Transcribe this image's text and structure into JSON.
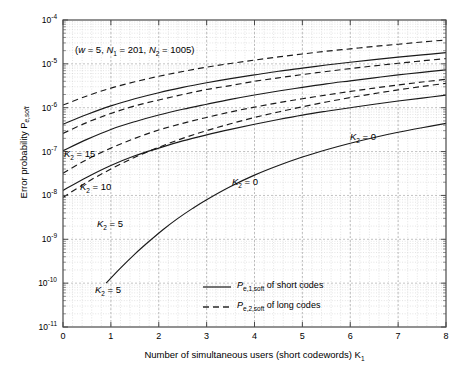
{
  "chart_data": {
    "type": "line",
    "title": "",
    "xlabel": "Number of simultaneous users  (short codewords)   K",
    "xlabel_sub": "1",
    "ylabel": "Error probability   P",
    "ylabel_sub": "e,soft",
    "annotation": "(w = 5, N1 = 201, N2 = 1005)",
    "annotation_parts": {
      "open": "(",
      "w": "w",
      "w_val": " = 5, ",
      "n1": "N",
      "n1_sub": "1",
      "n1_val": " = 201, ",
      "n2": "N",
      "n2_sub": "2",
      "n2_val": " = 1005)"
    },
    "xlim": [
      0,
      8
    ],
    "ylim": [
      1e-11,
      0.0001
    ],
    "yscale": "log",
    "xscale": "linear",
    "xticks": [
      0,
      1,
      2,
      3,
      4,
      5,
      6,
      7,
      8
    ],
    "xticklabels": [
      "0",
      "1",
      "2",
      "3",
      "4",
      "5",
      "6",
      "7",
      "8"
    ],
    "yticks": [
      0.0001,
      1e-05,
      1e-06,
      1e-07,
      1e-08,
      1e-09,
      1e-10,
      1e-11
    ],
    "yticklabels": [
      "10-4",
      "10-5",
      "10-6",
      "10-7",
      "10-8",
      "10-9",
      "10-10",
      "10-11"
    ],
    "yticklabels_exp": [
      "-4",
      "-5",
      "-6",
      "-7",
      "-8",
      "-9",
      "-10",
      "-11"
    ],
    "grid": true,
    "grid_minor": true,
    "legend": {
      "position": "lower-center-right",
      "entries": [
        {
          "style": "solid",
          "symbol": "P",
          "sub": "e,1,soft",
          "text": " of short codes"
        },
        {
          "style": "dashed",
          "symbol": "P",
          "sub": "e,2,soft",
          "text": " of long codes"
        }
      ]
    },
    "curve_labels": [
      {
        "text": "K",
        "sub": "2",
        "value": " = 15",
        "x_px": 64,
        "y_px": 148
      },
      {
        "text": "K",
        "sub": "2",
        "value": " = 10",
        "x_px": 80,
        "y_px": 181
      },
      {
        "text": "K",
        "sub": "2",
        "value": " = 5",
        "x_px": 97,
        "y_px": 218
      },
      {
        "text": "K",
        "sub": "2",
        "value": " = 5",
        "x_px": 95,
        "y_px": 284
      },
      {
        "text": "K",
        "sub": "2",
        "value": " = 0",
        "x_px": 232,
        "y_px": 176
      },
      {
        "text": "K",
        "sub": "2",
        "value": " = 0",
        "x_px": 350,
        "y_px": 131
      }
    ],
    "series": [
      {
        "name": "Pe,1,soft K2=15",
        "style": "solid",
        "label": "K2 = 15",
        "points": [
          [
            0,
            1.05e-07
          ],
          [
            0.5,
            1.9e-07
          ],
          [
            1,
            3.2e-07
          ],
          [
            1.5,
            4.8e-07
          ],
          [
            2,
            6.8e-07
          ],
          [
            2.5,
            9.2e-07
          ],
          [
            3,
            1.2e-06
          ],
          [
            3.5,
            1.55e-06
          ],
          [
            4,
            1.95e-06
          ],
          [
            4.5,
            2.4e-06
          ],
          [
            5,
            2.9e-06
          ],
          [
            5.5,
            3.5e-06
          ],
          [
            6,
            4.1e-06
          ],
          [
            6.5,
            4.8e-06
          ],
          [
            7,
            5.6e-06
          ],
          [
            7.5,
            6.4e-06
          ],
          [
            8,
            7.3e-06
          ]
        ]
      },
      {
        "name": "Pe,2,soft K2=15",
        "style": "dashed",
        "label": "K2 = 15",
        "points": [
          [
            0,
            2.6e-07
          ],
          [
            0.5,
            4.6e-07
          ],
          [
            1,
            7.4e-07
          ],
          [
            1.5,
            1.1e-06
          ],
          [
            2,
            1.5e-06
          ],
          [
            2.5,
            2e-06
          ],
          [
            3,
            2.6e-06
          ],
          [
            3.5,
            3.2e-06
          ],
          [
            4,
            4e-06
          ],
          [
            4.5,
            4.8e-06
          ],
          [
            5,
            5.7e-06
          ],
          [
            5.5,
            6.7e-06
          ],
          [
            6,
            7.8e-06
          ],
          [
            6.5,
            9e-06
          ],
          [
            7,
            1.03e-05
          ],
          [
            7.5,
            1.17e-05
          ],
          [
            8,
            1.32e-05
          ]
        ]
      },
      {
        "name": "Pe,1,soft K2=10",
        "style": "solid",
        "label": "K2 = 10",
        "points": [
          [
            0,
            1.3e-08
          ],
          [
            0.5,
            2.6e-08
          ],
          [
            1,
            4.8e-08
          ],
          [
            1.5,
            8e-08
          ],
          [
            2,
            1.2e-07
          ],
          [
            2.5,
            1.75e-07
          ],
          [
            3,
            2.4e-07
          ],
          [
            3.5,
            3.2e-07
          ],
          [
            4,
            4.2e-07
          ],
          [
            4.5,
            5.4e-07
          ],
          [
            5,
            6.8e-07
          ],
          [
            5.5,
            8.3e-07
          ],
          [
            6,
            1e-06
          ],
          [
            6.5,
            1.2e-06
          ],
          [
            7,
            1.42e-06
          ],
          [
            7.5,
            1.66e-06
          ],
          [
            8,
            1.93e-06
          ]
        ]
      },
      {
        "name": "Pe,2,soft K2=10",
        "style": "dashed",
        "label": "K2 = 10",
        "points": [
          [
            0,
            3.2e-08
          ],
          [
            0.5,
            6.6e-08
          ],
          [
            1,
            1.2e-07
          ],
          [
            1.5,
            2e-07
          ],
          [
            2,
            3.1e-07
          ],
          [
            2.5,
            4.4e-07
          ],
          [
            3,
            6e-07
          ],
          [
            3.5,
            8e-07
          ],
          [
            4,
            1.03e-06
          ],
          [
            4.5,
            1.3e-06
          ],
          [
            5,
            1.6e-06
          ],
          [
            5.5,
            1.95e-06
          ],
          [
            6,
            2.35e-06
          ],
          [
            6.5,
            2.8e-06
          ],
          [
            7,
            3.3e-06
          ],
          [
            7.5,
            3.85e-06
          ],
          [
            8,
            4.45e-06
          ]
        ]
      },
      {
        "name": "Pe,1,soft K2=5",
        "style": "solid",
        "label": "K2 = 5",
        "points": [
          [
            0.9,
            1e-10
          ],
          [
            1.2,
            2.2e-10
          ],
          [
            1.5,
            4.6e-10
          ],
          [
            1.8,
            9e-10
          ],
          [
            2.1,
            1.7e-09
          ],
          [
            2.4,
            3e-09
          ],
          [
            2.7,
            5e-09
          ],
          [
            3,
            8e-09
          ],
          [
            3.5,
            1.6e-08
          ],
          [
            4,
            2.9e-08
          ],
          [
            4.5,
            4.8e-08
          ],
          [
            5,
            7.5e-08
          ],
          [
            5.5,
            1.1e-07
          ],
          [
            6,
            1.55e-07
          ],
          [
            6.5,
            2.1e-07
          ],
          [
            7,
            2.75e-07
          ],
          [
            7.5,
            3.5e-07
          ],
          [
            8,
            4.4e-07
          ]
        ]
      },
      {
        "name": "Pe,2,soft K2=5",
        "style": "dashed",
        "label": "K2 = 5",
        "points": [
          [
            0,
            9e-09
          ],
          [
            0.5,
            2e-08
          ],
          [
            1,
            4e-08
          ],
          [
            1.5,
            7.4e-08
          ],
          [
            2,
            1.25e-07
          ],
          [
            2.5,
            2e-07
          ],
          [
            3,
            3e-07
          ],
          [
            3.5,
            4.3e-07
          ],
          [
            4,
            6e-07
          ],
          [
            4.5,
            8e-07
          ],
          [
            5,
            1.05e-06
          ],
          [
            5.5,
            1.35e-06
          ],
          [
            6,
            1.7e-06
          ],
          [
            6.5,
            2.1e-06
          ],
          [
            7,
            2.55e-06
          ],
          [
            7.5,
            3.05e-06
          ],
          [
            8,
            3.6e-06
          ]
        ]
      },
      {
        "name": "Pe,1,soft K2=0",
        "style": "solid",
        "label": "K2 = 0",
        "points": [
          [
            0,
            4.2e-07
          ],
          [
            0.5,
            7e-07
          ],
          [
            1,
            1.1e-06
          ],
          [
            1.5,
            1.6e-06
          ],
          [
            2,
            2.2e-06
          ],
          [
            2.5,
            2.9e-06
          ],
          [
            3,
            3.7e-06
          ],
          [
            3.5,
            4.6e-06
          ],
          [
            4,
            5.6e-06
          ],
          [
            4.5,
            6.8e-06
          ],
          [
            5,
            8e-06
          ],
          [
            5.5,
            9.4e-06
          ],
          [
            6,
            1.09e-05
          ],
          [
            6.5,
            1.25e-05
          ],
          [
            7,
            1.42e-05
          ],
          [
            7.5,
            1.6e-05
          ],
          [
            8,
            1.8e-05
          ]
        ]
      },
      {
        "name": "Pe,2,soft K2=0",
        "style": "dashed",
        "label": "K2 = 0",
        "points": [
          [
            0,
            1.15e-06
          ],
          [
            0.5,
            1.85e-06
          ],
          [
            1,
            2.8e-06
          ],
          [
            1.5,
            3.9e-06
          ],
          [
            2,
            5.2e-06
          ],
          [
            2.5,
            6.7e-06
          ],
          [
            3,
            8.4e-06
          ],
          [
            3.5,
            1.02e-05
          ],
          [
            4,
            1.22e-05
          ],
          [
            4.5,
            1.44e-05
          ],
          [
            5,
            1.68e-05
          ],
          [
            5.5,
            1.94e-05
          ],
          [
            6,
            2.2e-05
          ],
          [
            6.5,
            2.5e-05
          ],
          [
            7,
            2.8e-05
          ],
          [
            7.5,
            3.15e-05
          ],
          [
            8,
            3.5e-05
          ]
        ]
      }
    ]
  }
}
